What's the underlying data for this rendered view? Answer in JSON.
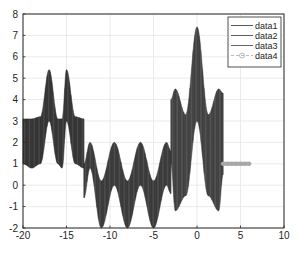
{
  "chart_data": {
    "type": "line",
    "title": "",
    "xlabel": "",
    "ylabel": "",
    "xlim": [
      -20,
      10
    ],
    "ylim": [
      -2,
      8
    ],
    "xticks": [
      -20,
      -15,
      -10,
      -5,
      0,
      5,
      10
    ],
    "yticks": [
      -2,
      -1,
      0,
      1,
      2,
      3,
      4,
      5,
      6,
      7,
      8
    ],
    "grid": true,
    "legend_position": "northeast",
    "series": [
      {
        "name": "data1",
        "color": "#2b2b2b",
        "style": "dense oscillation band",
        "x_range": [
          -20,
          -13
        ],
        "upper": [
          [
            -20,
            3.1
          ],
          [
            -19,
            3.1
          ],
          [
            -18,
            3.2
          ],
          [
            -17,
            5.4
          ],
          [
            -16,
            3.1
          ],
          [
            -15.5,
            3.1
          ],
          [
            -15,
            5.4
          ],
          [
            -14,
            3.2
          ],
          [
            -13,
            3.1
          ]
        ],
        "lower": [
          [
            -20,
            1.0
          ],
          [
            -19,
            0.8
          ],
          [
            -18,
            1.0
          ],
          [
            -17,
            3.0
          ],
          [
            -16,
            1.0
          ],
          [
            -15.5,
            0.8
          ],
          [
            -15,
            3.0
          ],
          [
            -14,
            1.0
          ],
          [
            -13,
            0.8
          ]
        ]
      },
      {
        "name": "data2",
        "color": "#333333",
        "style": "dense oscillation band",
        "x_range": [
          -13,
          -3
        ],
        "upper": [
          [
            -13,
            1.0
          ],
          [
            -12.3,
            2.0
          ],
          [
            -11,
            0.2
          ],
          [
            -9.5,
            2.0
          ],
          [
            -8,
            0.2
          ],
          [
            -6.5,
            2.0
          ],
          [
            -5,
            0.2
          ],
          [
            -3.5,
            2.0
          ],
          [
            -3,
            1.6
          ]
        ],
        "lower": [
          [
            -13,
            -0.6
          ],
          [
            -12.3,
            0.8
          ],
          [
            -11,
            -2.0
          ],
          [
            -9.5,
            0.0
          ],
          [
            -8,
            -2.0
          ],
          [
            -6.5,
            0.0
          ],
          [
            -5,
            -2.0
          ],
          [
            -3.5,
            0.0
          ],
          [
            -3,
            -0.4
          ]
        ]
      },
      {
        "name": "data3",
        "color": "#3d3d3d",
        "style": "dense oscillation band",
        "x_range": [
          -3,
          3
        ],
        "upper": [
          [
            -3,
            4.0
          ],
          [
            -2.5,
            4.5
          ],
          [
            -1.3,
            3.3
          ],
          [
            0,
            7.4
          ],
          [
            1.3,
            3.3
          ],
          [
            2.5,
            4.5
          ],
          [
            3,
            4.3
          ]
        ],
        "lower": [
          [
            -3,
            1.0
          ],
          [
            -2.5,
            -1.2
          ],
          [
            -1.3,
            -0.5
          ],
          [
            0,
            3.0
          ],
          [
            1.3,
            -0.5
          ],
          [
            2.5,
            -1.2
          ],
          [
            3,
            0.5
          ]
        ]
      },
      {
        "name": "data4",
        "color": "#a8a8a8",
        "style": "thick line with circle markers",
        "x": [
          3,
          3.5,
          4,
          4.5,
          5,
          5.5,
          6
        ],
        "y": [
          1,
          1,
          1,
          1,
          1,
          1,
          1
        ]
      }
    ]
  },
  "legend": {
    "items": [
      {
        "label": "data1"
      },
      {
        "label": "data2"
      },
      {
        "label": "data3"
      },
      {
        "label": "data4"
      }
    ]
  },
  "axes": {
    "x_tick_labels": [
      "-20",
      "-15",
      "-10",
      "-5",
      "0",
      "5",
      "10"
    ],
    "y_tick_labels": [
      "-2",
      "-1",
      "0",
      "1",
      "2",
      "3",
      "4",
      "5",
      "6",
      "7",
      "8"
    ]
  }
}
